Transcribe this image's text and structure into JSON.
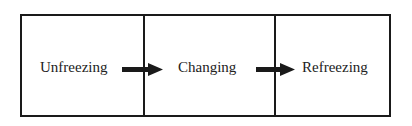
{
  "diagram": {
    "type": "process-flow",
    "stages": [
      {
        "label": "Unfreezing"
      },
      {
        "label": "Changing"
      },
      {
        "label": "Refreezing"
      }
    ],
    "connectors": [
      {
        "from": "Unfreezing",
        "to": "Changing"
      },
      {
        "from": "Changing",
        "to": "Refreezing"
      }
    ],
    "colors": {
      "line": "#1a1a1a",
      "text": "#222222",
      "background": "#ffffff"
    }
  }
}
